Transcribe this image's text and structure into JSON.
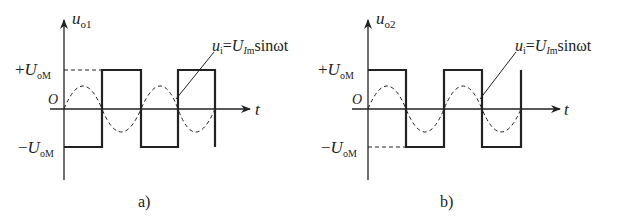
{
  "panels": [
    {
      "id": "a",
      "y_label_main": "u",
      "y_label_sub": "o1",
      "x_label": "t",
      "origin": "O",
      "pos_level_sign": "+",
      "pos_level_main": "U",
      "pos_level_sub": "oM",
      "neg_level_sign": "−",
      "neg_level_main": "U",
      "neg_level_sub": "oM",
      "annotation_u": "u",
      "annotation_u_sub": "i",
      "annotation_eq": "=",
      "annotation_U": "U",
      "annotation_U_sub_i": "I",
      "annotation_U_sub_m": "m",
      "annotation_tail": "sinωt",
      "caption": "a)"
    },
    {
      "id": "b",
      "y_label_main": "u",
      "y_label_sub": "o2",
      "x_label": "t",
      "origin": "O",
      "pos_level_sign": "+",
      "pos_level_main": "U",
      "pos_level_sub": "oM",
      "neg_level_sign": "−",
      "neg_level_main": "U",
      "neg_level_sub": "oM",
      "annotation_u": "u",
      "annotation_u_sub": "i",
      "annotation_eq": "=",
      "annotation_U": "U",
      "annotation_U_sub_i": "I",
      "annotation_U_sub_m": "m",
      "annotation_tail": "sinωt",
      "caption": "b)"
    }
  ],
  "colors": {
    "stroke": "#222222",
    "background": "#ffffff"
  }
}
